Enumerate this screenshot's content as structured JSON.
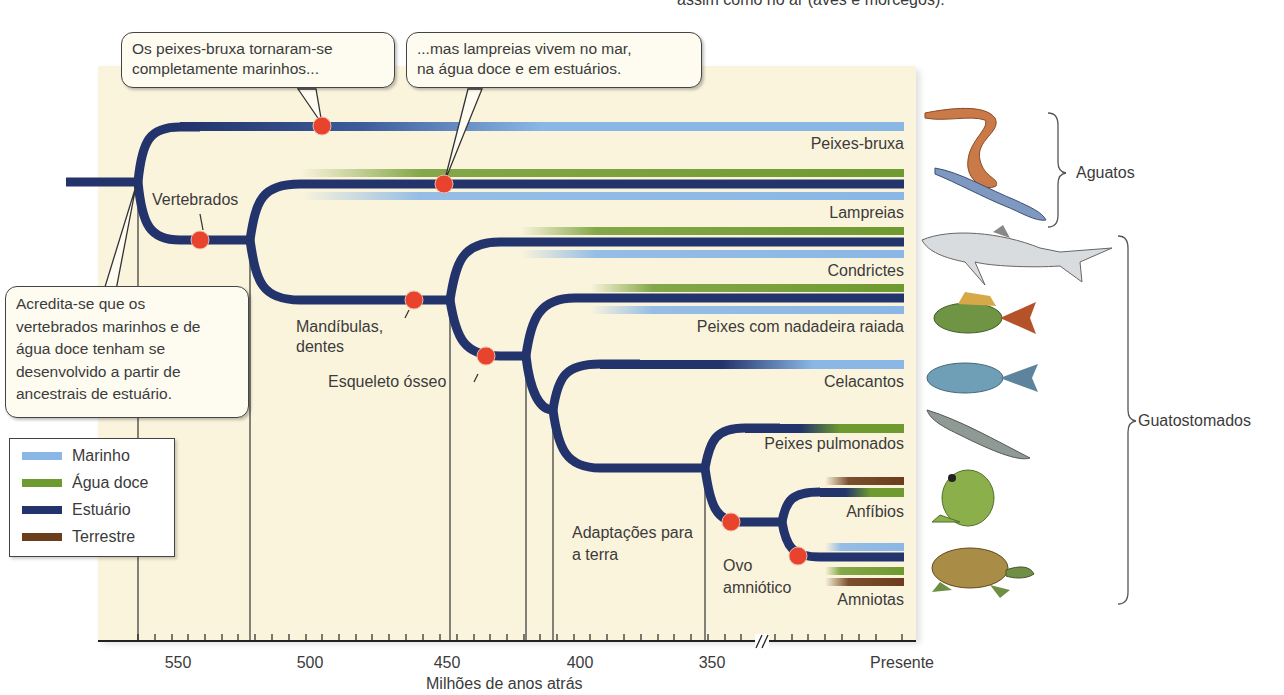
{
  "header": {
    "top_caption_fragment": "assim como no ar (aves e morcegos)."
  },
  "colors": {
    "marinho": "#8ab7e6",
    "agua_doce": "#6f9a2f",
    "estuario": "#23336b",
    "terrestre": "#6b3d1c",
    "event_dot": "#e8432c",
    "panel_bg": "#fbf4dc"
  },
  "callouts": {
    "hagfish": "Os peixes-bruxa tornaram-se\ncompletamente marinhos...",
    "hagfish_line1": "Os peixes-bruxa tornaram-se",
    "hagfish_line2": "completamente marinhos...",
    "lamprey_line1": "...mas lampreias vivem no mar,",
    "lamprey_line2": "na água doce e em estuários.",
    "origin_line1": "Acredita-se que os",
    "origin_line2": "vertebrados marinhos e de",
    "origin_line3": "água doce tenham se",
    "origin_line4": "desenvolvido a partir de",
    "origin_line5": "ancestrais de estuário."
  },
  "events": {
    "vertebrados": "Vertebrados",
    "mandibulas_1": "Mandíbulas,",
    "mandibulas_2": "dentes",
    "esqueleto": "Esqueleto ósseo",
    "adaptacoes_1": "Adaptações para",
    "adaptacoes_2": "a terra",
    "ovo_1": "Ovo",
    "ovo_2": "amniótico"
  },
  "lineages": [
    {
      "name": "Peixes-bruxa",
      "habitats": [
        "Marinho"
      ]
    },
    {
      "name": "Lampreias",
      "habitats": [
        "Água doce",
        "Estuário",
        "Marinho"
      ]
    },
    {
      "name": "Condrictes",
      "habitats": [
        "Água doce",
        "Estuário",
        "Marinho"
      ]
    },
    {
      "name": "Peixes com nadadeira raiada",
      "habitats": [
        "Água doce",
        "Estuário",
        "Marinho"
      ]
    },
    {
      "name": "Celacantos",
      "habitats": [
        "Marinho"
      ]
    },
    {
      "name": "Peixes pulmonados",
      "habitats": [
        "Água doce"
      ]
    },
    {
      "name": "Anfíbios",
      "habitats": [
        "Terrestre",
        "Água doce"
      ]
    },
    {
      "name": "Amniotas",
      "habitats": [
        "Marinho",
        "Estuário",
        "Água doce",
        "Terrestre"
      ]
    }
  ],
  "legend": {
    "items": [
      {
        "label": "Marinho",
        "color": "#8ab7e6"
      },
      {
        "label": "Água doce",
        "color": "#6f9a2f"
      },
      {
        "label": "Estuário",
        "color": "#23336b"
      },
      {
        "label": "Terrestre",
        "color": "#6b3d1c"
      }
    ]
  },
  "axis": {
    "title": "Milhões de anos atrás",
    "ticks": [
      "550",
      "500",
      "450",
      "400",
      "350",
      "Presente"
    ]
  },
  "groups": {
    "aguatos": "Aguatos",
    "guatostomados": "Guatostomados"
  },
  "animals": [
    {
      "name": "hagfish-illustration"
    },
    {
      "name": "lamprey-illustration"
    },
    {
      "name": "shark-illustration"
    },
    {
      "name": "perch-illustration"
    },
    {
      "name": "coelacanth-illustration"
    },
    {
      "name": "lungfish-illustration"
    },
    {
      "name": "frog-illustration"
    },
    {
      "name": "turtle-illustration"
    }
  ]
}
